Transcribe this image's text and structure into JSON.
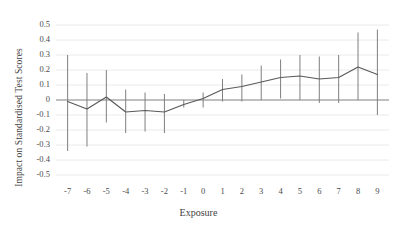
{
  "chart_data": {
    "type": "line",
    "title": "",
    "xlabel": "Exposure",
    "ylabel": "Impact on Standardised Test Scores",
    "xlim": [
      -7.6,
      9.6
    ],
    "ylim": [
      -0.5,
      0.5
    ],
    "grid": true,
    "legend": false,
    "xticklabels": [
      "-7",
      "-6",
      "-5",
      "-4",
      "-3",
      "-2",
      "-1",
      "0",
      "1",
      "2",
      "3",
      "4",
      "5",
      "6",
      "7",
      "8",
      "9"
    ],
    "yticklabels": [
      "0.5",
      "0.4",
      "0.3",
      "0.2",
      "0.1",
      "0",
      "-0.1",
      "-0.2",
      "-0.3",
      "-0.4",
      "-0.5"
    ],
    "ytickvalues": [
      0.5,
      0.4,
      0.3,
      0.2,
      0.1,
      0,
      -0.1,
      -0.2,
      -0.3,
      -0.4,
      -0.5
    ],
    "x": [
      -7,
      -6,
      -5,
      -4,
      -3,
      -2,
      -1,
      0,
      1,
      2,
      3,
      4,
      5,
      6,
      7,
      8,
      9
    ],
    "values": [
      -0.01,
      -0.06,
      0.02,
      -0.08,
      -0.07,
      -0.08,
      -0.03,
      0.01,
      0.07,
      0.09,
      0.12,
      0.15,
      0.16,
      0.14,
      0.15,
      0.22,
      0.17
    ],
    "errorbar_low": [
      -0.34,
      -0.31,
      -0.15,
      -0.22,
      -0.21,
      -0.22,
      -0.05,
      -0.05,
      -0.01,
      -0.01,
      0.0,
      0.01,
      0.0,
      -0.02,
      -0.02,
      0.0,
      -0.1
    ],
    "errorbar_high": [
      0.3,
      0.18,
      0.2,
      0.07,
      0.05,
      0.04,
      0.0,
      0.05,
      0.14,
      0.17,
      0.23,
      0.27,
      0.3,
      0.29,
      0.3,
      0.45,
      0.47
    ],
    "series_name": "Estimated impact",
    "line_color": "#595959",
    "errorbar_color": "#7f7f7f",
    "grid_color": "#e8e8e8",
    "zero_line_color": "#808080"
  }
}
